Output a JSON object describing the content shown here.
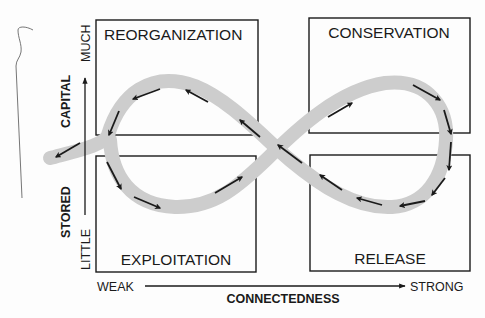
{
  "diagram": {
    "type": "adaptive-cycle",
    "phases": [
      {
        "id": "reorganization",
        "label": "REORGANIZATION",
        "position": "top-left"
      },
      {
        "id": "conservation",
        "label": "CONSERVATION",
        "position": "top-right"
      },
      {
        "id": "exploitation",
        "label": "EXPLOITATION",
        "position": "bottom-left"
      },
      {
        "id": "release",
        "label": "RELEASE",
        "position": "bottom-right"
      }
    ],
    "y_axis": {
      "title_top": "CAPITAL",
      "title_bottom": "STORED",
      "high_label": "MUCH",
      "low_label": "LITTLE"
    },
    "x_axis": {
      "title": "CONNECTEDNESS",
      "low_label": "WEAK",
      "high_label": "STRONG"
    },
    "flow": {
      "description": "Figure-eight loop: exploitation -> conservation -> release -> reorganization -> exploitation, with an exit arrow leaving the cycle to the left",
      "sequence": [
        "exploitation",
        "conservation",
        "release",
        "reorganization",
        "exploitation"
      ],
      "exit_arrow": "leftward from reorganization/exploitation junction",
      "ribbon_color": "#cccccc",
      "arrow_color": "#1a1a1a"
    }
  }
}
